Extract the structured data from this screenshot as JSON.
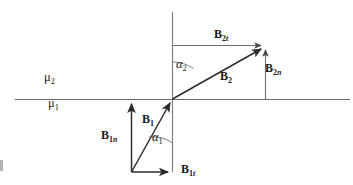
{
  "figure": {
    "type": "vector-refraction-diagram",
    "background_color": "#ffffff",
    "line_color": "#3a3a3a",
    "text_color": "#1a1a1a"
  },
  "media_labels": {
    "upper": {
      "symbol": "μ",
      "subscript": "2",
      "x": 48,
      "y": 78
    },
    "lower": {
      "symbol": "μ",
      "subscript": "1",
      "x": 52,
      "y": 103
    }
  },
  "angles": [
    {
      "name": "alpha-2",
      "symbol": "α",
      "subscript": "2",
      "x": 162,
      "y": 62,
      "value_deg": 62
    },
    {
      "name": "alpha-1",
      "symbol": "α",
      "subscript": "1",
      "x": 152,
      "y": 131,
      "value_deg": 24
    }
  ],
  "vectors": [
    {
      "name": "B2t",
      "base": "B",
      "subscript_num": "2",
      "subscript_letter": "t",
      "x": 214,
      "y": 30
    },
    {
      "name": "B2n",
      "base": "B",
      "subscript_num": "2",
      "subscript_letter": "n",
      "x": 264,
      "y": 64
    },
    {
      "name": "B2",
      "base": "B",
      "subscript_num": "2",
      "subscript_letter": "",
      "x": 219,
      "y": 72
    },
    {
      "name": "B1",
      "base": "B",
      "subscript_num": "1",
      "subscript_letter": "",
      "x": 142,
      "y": 115
    },
    {
      "name": "B1n",
      "base": "B",
      "subscript_num": "1",
      "subscript_letter": "n",
      "x": 102,
      "y": 130
    },
    {
      "name": "B1t",
      "base": "B",
      "subscript_num": "1",
      "subscript_letter": "t",
      "x": 180,
      "y": 155
    }
  ],
  "geometry": {
    "origin": {
      "x": 172,
      "y": 99
    },
    "interface_line": {
      "x1": 15,
      "y1": 99,
      "x2": 350,
      "y2": 99
    },
    "normal_line": {
      "x1": 172,
      "y1": 12,
      "x2": 172,
      "y2": 172
    },
    "b2_tip": {
      "x": 265,
      "y": 46
    },
    "b1_tail": {
      "x": 131,
      "y": 172
    },
    "b2t_dashline": {
      "x1": 172,
      "y1": 45,
      "x2": 265,
      "y2": 45
    },
    "b2n_dashline": {
      "x1": 265,
      "y1": 99,
      "x2": 265,
      "y2": 46
    },
    "b1n_line": {
      "x1": 131,
      "y1": 172,
      "x2": 131,
      "y2": 100
    },
    "b1t_line": {
      "x1": 131,
      "y1": 172,
      "x2": 172,
      "y2": 172
    }
  }
}
